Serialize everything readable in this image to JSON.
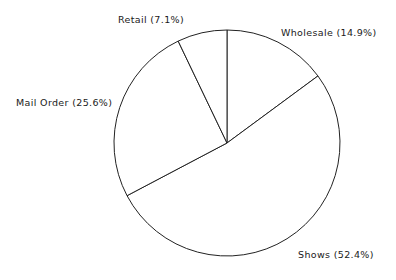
{
  "chart_data": {
    "type": "pie",
    "title": "",
    "subtitle": "",
    "xlabel": "",
    "ylabel": "",
    "grid": false,
    "legend_position": "none",
    "label_format": "{name} ({percent}%)",
    "start_angle_deg": 0,
    "direction": "clockwise",
    "categories": [
      "Wholesale",
      "Shows",
      "Mail Order",
      "Retail"
    ],
    "values": [
      14.9,
      52.4,
      25.6,
      7.1
    ],
    "units": "percent",
    "slices": [
      {
        "name": "Wholesale",
        "percent": 14.9,
        "label": "Wholesale (14.9%)",
        "start_deg": 0.0,
        "end_deg": 53.6,
        "fill": "#ffffff",
        "stroke": "#222222"
      },
      {
        "name": "Shows",
        "percent": 52.4,
        "label": "Shows (52.4%)",
        "start_deg": 53.6,
        "end_deg": 242.2,
        "fill": "#ffffff",
        "stroke": "#222222"
      },
      {
        "name": "Mail Order",
        "percent": 25.6,
        "label": "Mail Order (25.6%)",
        "start_deg": 242.2,
        "end_deg": 334.4,
        "fill": "#ffffff",
        "stroke": "#222222"
      },
      {
        "name": "Retail",
        "percent": 7.1,
        "label": "Retail (7.1%)",
        "start_deg": 334.4,
        "end_deg": 360.0,
        "fill": "#ffffff",
        "stroke": "#222222"
      }
    ],
    "geometry": {
      "center_x": 227,
      "center_y": 143,
      "radius": 113
    },
    "colors": {
      "background": "#ffffff",
      "outline": "#222222",
      "text": "#1a1a1a"
    }
  }
}
